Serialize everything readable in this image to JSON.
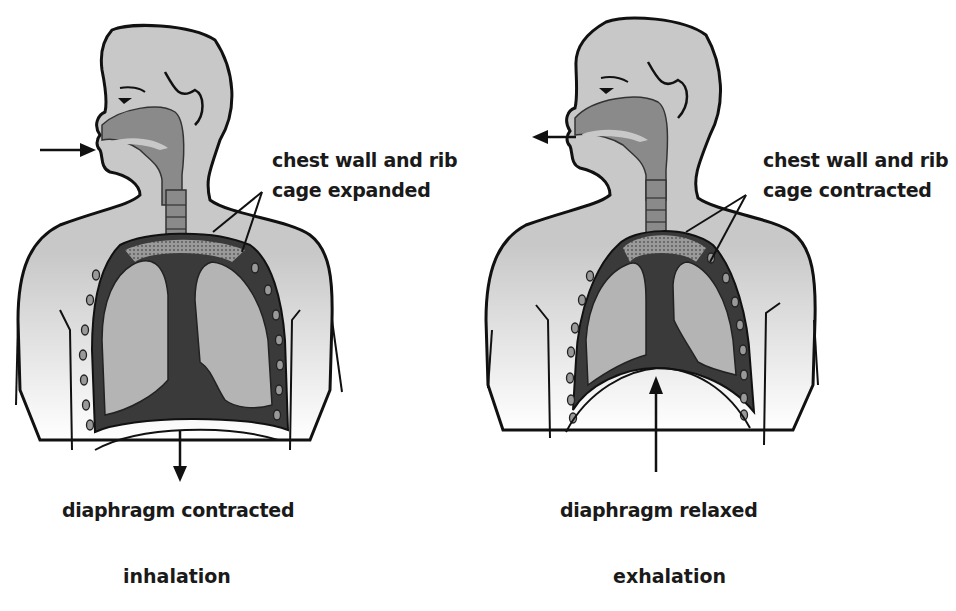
{
  "colors": {
    "skin": "#c8c8c8",
    "airway": "#8a8a8a",
    "lung": "#b4b4b4",
    "cavity": "#3a3a3a",
    "outline": "#111111",
    "background": "#ffffff"
  },
  "inhalation": {
    "caption": "inhalation",
    "chest_label_line1": "chest wall and rib",
    "chest_label_line2": "cage expanded",
    "diaphragm_label": "diaphragm contracted",
    "air_arrow": "arrow-into-mouth",
    "diaphragm_arrow": "arrow-down"
  },
  "exhalation": {
    "caption": "exhalation",
    "chest_label_line1": "chest wall and rib",
    "chest_label_line2": "cage contracted",
    "diaphragm_label": "diaphragm relaxed",
    "air_arrow": "arrow-out-of-mouth",
    "diaphragm_arrow": "arrow-up"
  }
}
